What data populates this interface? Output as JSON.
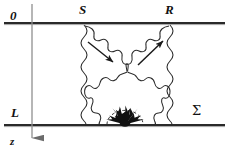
{
  "figure": {
    "kind": "physics-schematic-diagram",
    "background_color": "#ffffff",
    "ink_color": "#1a1a1a",
    "width": 229,
    "height": 160
  },
  "labels": {
    "top_boundary": "0",
    "bottom_boundary": "L",
    "axis": "z",
    "left_point": "S",
    "right_point": "R",
    "surface": "Σ"
  },
  "geometry": {
    "top_line_y": 23,
    "bottom_line_y": 125,
    "line_x_start": 4,
    "line_x_end": 225,
    "axis_x": 32,
    "axis_y_start": 4,
    "axis_y_end": 152,
    "point_S_x": 84,
    "point_R_x": 170,
    "crossing_x": 127,
    "crossing_y": 72,
    "burst_x": 125,
    "burst_y": 124
  },
  "elements": {
    "wavy_left_vertical": "vertical wavy line from S down to bottom boundary",
    "wavy_right_vertical": "vertical wavy line from R down to bottom boundary",
    "wavy_diagonal_S_to_center": "wavy diagonal from S down-right to crossing",
    "wavy_diagonal_R_to_center": "wavy diagonal from R down-left to crossing",
    "wavy_diagonal_center_to_left_bottom": "wavy diagonal from crossing down-left to bottom boundary",
    "wavy_diagonal_center_to_right_bottom": "wavy diagonal from crossing down-right to bottom boundary",
    "arrow_left": "straight arrow pointing down-right toward crossing",
    "arrow_right": "straight arrow pointing up-right toward R",
    "burst": "filled radiating burst of arrows at source on bottom boundary",
    "burst_halo": "dashed semicircular arc over the burst",
    "z_axis_arrow": "downward arrowhead terminating the z axis"
  }
}
